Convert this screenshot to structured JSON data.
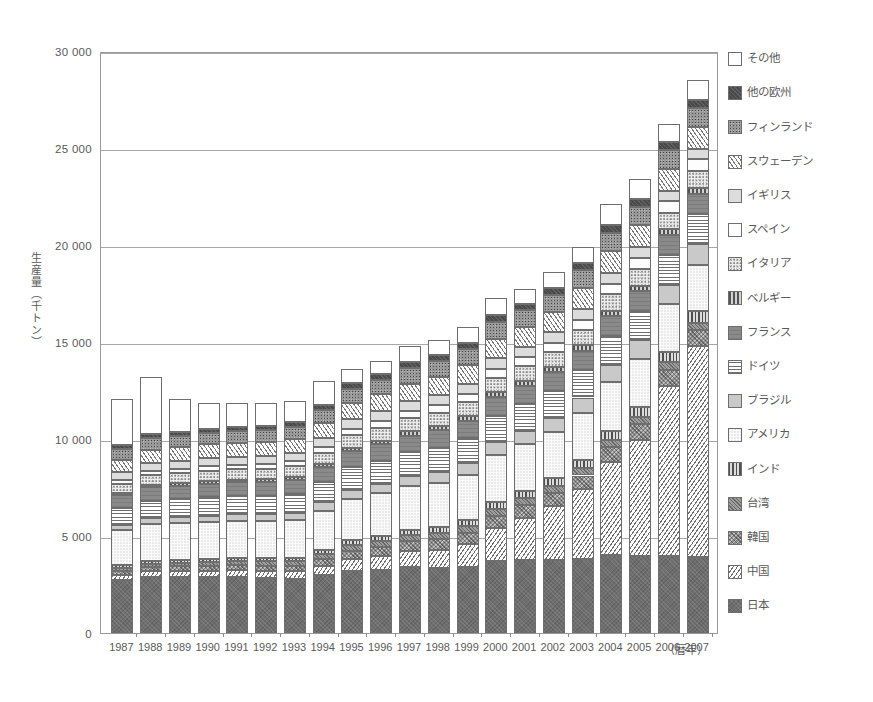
{
  "chart_data": {
    "type": "bar",
    "stacked": true,
    "title": "",
    "xlabel": "（暦年）",
    "ylabel": "生産量（千トン）",
    "ylim": [
      0,
      30000
    ],
    "yticks": [
      0,
      5000,
      10000,
      15000,
      20000,
      25000,
      30000
    ],
    "ytick_labels": [
      "0",
      "5 000",
      "10 000",
      "15 000",
      "20 000",
      "25 000",
      "30 000"
    ],
    "grid": true,
    "legend_position": "right",
    "categories": [
      "1987",
      "1988",
      "1989",
      "1990",
      "1991",
      "1992",
      "1993",
      "1994",
      "1995",
      "1996",
      "1997",
      "1998",
      "1999",
      "2000",
      "2001",
      "2002",
      "2003",
      "2004",
      "2005",
      "2006",
      "2007"
    ],
    "series": [
      {
        "name": "日本",
        "key": "p-jp",
        "values": [
          2750,
          2900,
          2900,
          2900,
          2900,
          2850,
          2800,
          3000,
          3200,
          3250,
          3400,
          3350,
          3400,
          3700,
          3750,
          3750,
          3800,
          4000,
          3950,
          3950,
          3900
        ]
      },
      {
        "name": "中国",
        "key": "p-cn",
        "values": [
          250,
          280,
          300,
          320,
          350,
          370,
          400,
          480,
          620,
          720,
          830,
          950,
          1200,
          1700,
          2200,
          2800,
          3600,
          4800,
          6000,
          8800,
          10900
        ]
      },
      {
        "name": "韓国",
        "key": "p-kr",
        "values": [
          200,
          220,
          230,
          240,
          250,
          260,
          280,
          330,
          420,
          470,
          500,
          530,
          570,
          630,
          650,
          680,
          720,
          780,
          800,
          820,
          830
        ]
      },
      {
        "name": "台湾",
        "key": "p-tw",
        "values": [
          170,
          180,
          190,
          200,
          200,
          210,
          220,
          250,
          290,
          300,
          310,
          320,
          330,
          350,
          350,
          360,
          370,
          380,
          380,
          380,
          370
        ]
      },
      {
        "name": "インド",
        "key": "p-in",
        "values": [
          120,
          130,
          140,
          150,
          160,
          170,
          180,
          200,
          240,
          260,
          280,
          300,
          320,
          360,
          380,
          400,
          430,
          470,
          500,
          540,
          580
        ]
      },
      {
        "name": "アメリカ",
        "key": "p-us",
        "values": [
          1800,
          1900,
          1900,
          1900,
          1900,
          1900,
          1950,
          2050,
          2150,
          2200,
          2250,
          2300,
          2350,
          2450,
          2400,
          2350,
          2400,
          2500,
          2500,
          2450,
          2400
        ]
      },
      {
        "name": "ブラジル",
        "key": "p-br",
        "values": [
          300,
          320,
          330,
          340,
          350,
          360,
          380,
          420,
          470,
          500,
          530,
          560,
          600,
          660,
          700,
          750,
          820,
          900,
          950,
          1000,
          1050
        ]
      },
      {
        "name": "ドイツ",
        "key": "p-de",
        "values": [
          850,
          900,
          920,
          950,
          950,
          960,
          980,
          1050,
          1150,
          1180,
          1220,
          1250,
          1280,
          1350,
          1350,
          1380,
          1420,
          1480,
          1500,
          1530,
          1550
        ]
      },
      {
        "name": "フランス",
        "key": "p-fr",
        "values": [
          650,
          680,
          690,
          700,
          700,
          700,
          710,
          760,
          820,
          840,
          860,
          880,
          900,
          950,
          950,
          970,
          1000,
          1030,
          1040,
          1050,
          1060
        ]
      },
      {
        "name": "ベルギー",
        "key": "p-be",
        "values": [
          130,
          140,
          140,
          150,
          150,
          150,
          160,
          170,
          190,
          200,
          210,
          220,
          230,
          250,
          250,
          260,
          270,
          280,
          290,
          290,
          300
        ]
      },
      {
        "name": "イタリア",
        "key": "p-it",
        "values": [
          480,
          500,
          510,
          520,
          520,
          530,
          540,
          580,
          640,
          660,
          680,
          700,
          720,
          760,
          760,
          780,
          810,
          840,
          850,
          860,
          870
        ]
      },
      {
        "name": "スペイン",
        "key": "p-es",
        "values": [
          200,
          220,
          230,
          240,
          250,
          260,
          270,
          300,
          340,
          360,
          380,
          400,
          420,
          460,
          470,
          490,
          520,
          550,
          570,
          580,
          600
        ]
      },
      {
        "name": "イギリス",
        "key": "p-gb",
        "values": [
          380,
          400,
          400,
          410,
          410,
          410,
          420,
          450,
          490,
          500,
          510,
          520,
          530,
          560,
          550,
          550,
          560,
          570,
          570,
          560,
          550
        ]
      },
      {
        "name": "スウェーデン",
        "key": "p-se",
        "values": [
          650,
          680,
          690,
          700,
          700,
          710,
          720,
          780,
          850,
          870,
          900,
          920,
          950,
          1000,
          1000,
          1020,
          1060,
          1100,
          1110,
          1120,
          1130
        ]
      },
      {
        "name": "フィンランド",
        "key": "p-fi",
        "values": [
          550,
          580,
          590,
          600,
          600,
          610,
          620,
          670,
          730,
          750,
          780,
          800,
          820,
          870,
          870,
          890,
          920,
          960,
          970,
          980,
          990
        ]
      },
      {
        "name": "他の欧州",
        "key": "p-eu",
        "values": [
          200,
          210,
          220,
          220,
          230,
          230,
          240,
          260,
          290,
          300,
          310,
          320,
          330,
          350,
          350,
          360,
          380,
          400,
          410,
          410,
          420
        ]
      },
      {
        "name": "その他",
        "key": "p-ot",
        "values": [
          2400,
          2950,
          1700,
          1300,
          1250,
          1200,
          1100,
          1250,
          700,
          650,
          850,
          800,
          850,
          850,
          750,
          800,
          800,
          1050,
          1000,
          900,
          1000
        ]
      }
    ],
    "totals": [
      11600,
      13290,
      12790,
      12740,
      12770,
      12640,
      12930,
      13700,
      15490,
      15510,
      16790,
      16820,
      17980,
      19700,
      18730,
      20590,
      22860,
      24490,
      23890,
      28220,
      28500
    ]
  },
  "legend": {
    "items": [
      {
        "label": "その他",
        "key": "p-ot"
      },
      {
        "label": "他の欧州",
        "key": "p-eu"
      },
      {
        "label": "フィンランド",
        "key": "p-fi"
      },
      {
        "label": "スウェーデン",
        "key": "p-se"
      },
      {
        "label": "イギリス",
        "key": "p-gb"
      },
      {
        "label": "スペイン",
        "key": "p-es"
      },
      {
        "label": "イタリア",
        "key": "p-it"
      },
      {
        "label": "ベルギー",
        "key": "p-be"
      },
      {
        "label": "フランス",
        "key": "p-fr"
      },
      {
        "label": "ドイツ",
        "key": "p-de"
      },
      {
        "label": "ブラジル",
        "key": "p-br"
      },
      {
        "label": "アメリカ",
        "key": "p-us"
      },
      {
        "label": "インド",
        "key": "p-in"
      },
      {
        "label": "台湾",
        "key": "p-tw"
      },
      {
        "label": "韓国",
        "key": "p-kr"
      },
      {
        "label": "中国",
        "key": "p-cn"
      },
      {
        "label": "日本",
        "key": "p-jp"
      }
    ]
  },
  "colors": {
    "axis": "#9a9a9a",
    "grid": "#a8a8a8",
    "text": "#5a5a5a",
    "bar_outline": "#6e6e6e",
    "background": "#ffffff"
  }
}
